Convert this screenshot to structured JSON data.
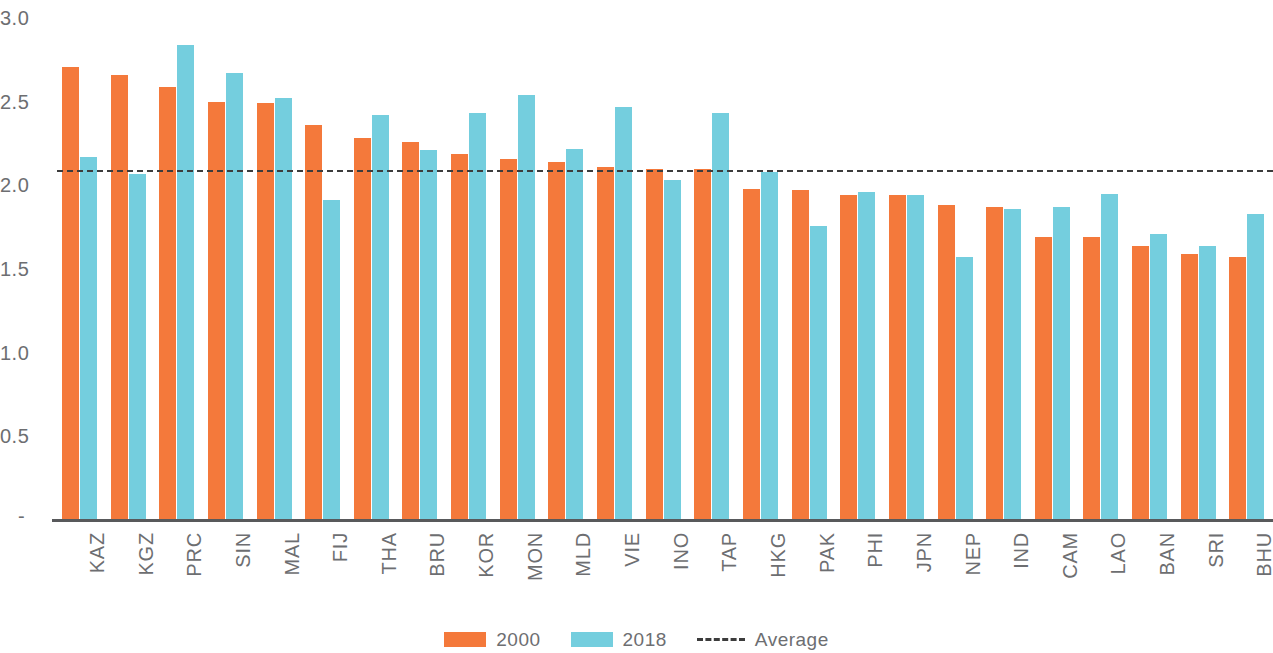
{
  "chart_data": {
    "type": "bar",
    "title": "",
    "subtitle": "",
    "xlabel": "",
    "ylabel": "",
    "ylim": [
      0,
      3.0
    ],
    "ytick_labels": [
      "3.0",
      "2.5",
      "2.0",
      "1.5",
      "1.0",
      "0.5",
      "-"
    ],
    "ytick_values": [
      3.0,
      2.5,
      2.0,
      1.5,
      1.0,
      0.5,
      0
    ],
    "grid": false,
    "legend_position": "bottom",
    "categories": [
      "KAZ",
      "KGZ",
      "PRC",
      "SIN",
      "MAL",
      "FIJ",
      "THA",
      "BRU",
      "KOR",
      "MON",
      "MLD",
      "VIE",
      "INO",
      "TAP",
      "HKG",
      "PAK",
      "PHI",
      "JPN",
      "NEP",
      "IND",
      "CAM",
      "LAO",
      "BAN",
      "SRI",
      "BHU"
    ],
    "series": [
      {
        "name": "2000",
        "color": "#F4793B",
        "values": [
          2.71,
          2.66,
          2.59,
          2.5,
          2.49,
          2.36,
          2.28,
          2.26,
          2.19,
          2.16,
          2.14,
          2.11,
          2.1,
          2.1,
          1.98,
          1.97,
          1.94,
          1.94,
          1.88,
          1.87,
          1.69,
          1.69,
          1.64,
          1.59,
          1.57
        ]
      },
      {
        "name": "2018",
        "color": "#74CEDE",
        "values": [
          2.17,
          2.07,
          2.84,
          2.67,
          2.52,
          1.91,
          2.42,
          2.21,
          2.43,
          2.54,
          2.22,
          2.47,
          2.03,
          2.43,
          2.08,
          1.76,
          1.96,
          1.94,
          1.57,
          1.86,
          1.87,
          1.95,
          1.71,
          1.64,
          1.83
        ]
      }
    ],
    "average": {
      "label": "Average",
      "value": 2.09,
      "style": "dashed",
      "color": "#3c3c3c"
    },
    "annotations": []
  },
  "legend": {
    "items": [
      {
        "label": "2000",
        "type": "swatch",
        "color": "#F4793B",
        "icon": "orange-square-swatch"
      },
      {
        "label": "2018",
        "type": "swatch",
        "color": "#74CEDE",
        "icon": "blue-square-swatch"
      },
      {
        "label": "Average",
        "type": "dash",
        "color": "#3c3c3c",
        "icon": "dashed-line-icon"
      }
    ]
  }
}
